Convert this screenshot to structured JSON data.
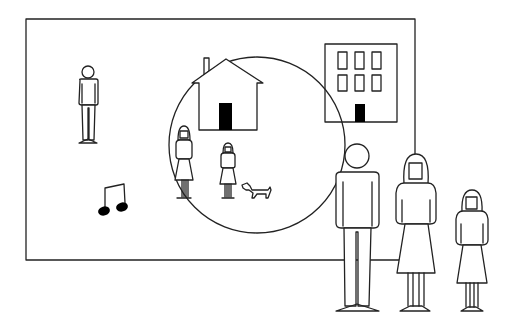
{
  "scene": {
    "description": "Line-art illustration: a framed picture containing a lone person, a music note, an apartment building, and a circle enclosing a house, a woman, a girl and a dog; in front, a man, a woman and a girl stand at the bottom right.",
    "colors": {
      "line": "#222222",
      "fill": "#000000",
      "background": "#ffffff"
    },
    "frame": {
      "x": 26,
      "y": 19,
      "width": 389,
      "height": 241
    },
    "circle": {
      "cx": 257,
      "cy": 145,
      "r": 88
    },
    "elements": [
      {
        "id": "lone-person",
        "icon": "person-icon"
      },
      {
        "id": "music-note",
        "icon": "beamed-eighth-notes-icon"
      },
      {
        "id": "house",
        "icon": "house-icon"
      },
      {
        "id": "building",
        "icon": "apartment-building-icon",
        "windows": 6
      },
      {
        "id": "woman-in-circle",
        "icon": "woman-icon"
      },
      {
        "id": "girl-in-circle",
        "icon": "girl-icon"
      },
      {
        "id": "dog",
        "icon": "dog-icon"
      },
      {
        "id": "man-foreground",
        "icon": "man-icon"
      },
      {
        "id": "woman-foreground",
        "icon": "woman-icon"
      },
      {
        "id": "girl-foreground",
        "icon": "girl-icon"
      }
    ]
  }
}
